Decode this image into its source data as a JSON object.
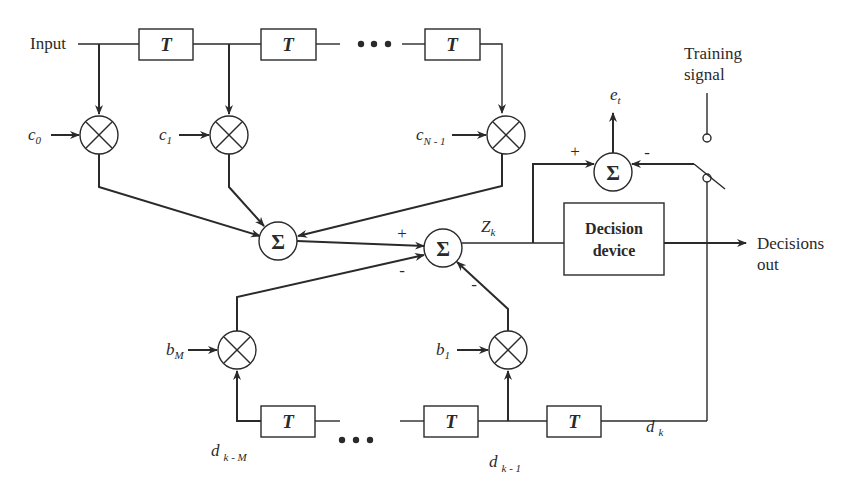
{
  "diagram": {
    "colors": {
      "stroke": "#2a2a2a",
      "background": "#ffffff"
    },
    "input_label": "Input",
    "delay_label": "T",
    "sum_symbol": "Σ",
    "ellipsis": "•••",
    "feedforward": {
      "coefficients": [
        {
          "base": "c",
          "sub": "0"
        },
        {
          "base": "c",
          "sub": "1"
        },
        {
          "base": "c",
          "sub": "N - 1"
        }
      ]
    },
    "feedback": {
      "coefficients": [
        {
          "base": "b",
          "sub": "M"
        },
        {
          "base": "b",
          "sub": "1"
        }
      ],
      "taps": [
        {
          "base": "d",
          "sub": "k - M"
        },
        {
          "base": "d",
          "sub": "k - 1"
        },
        {
          "base": "d",
          "sub": "k"
        }
      ]
    },
    "summer_signs": {
      "main_plus": "+",
      "main_minus_left": "-",
      "main_minus_right": "-",
      "error_plus": "+",
      "error_minus": "-"
    },
    "z_label": {
      "base": "Z",
      "sub": "k"
    },
    "error_label": {
      "base": "e",
      "sub": "t"
    },
    "training_signal": {
      "line1": "Training",
      "line2": "signal"
    },
    "decision_device": {
      "line1": "Decision",
      "line2": "device"
    },
    "output_label": {
      "line1": "Decisions",
      "line2": "out"
    }
  }
}
